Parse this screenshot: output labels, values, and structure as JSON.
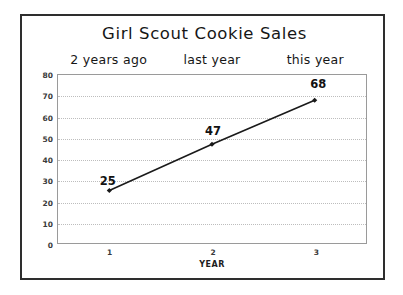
{
  "chart_data": {
    "type": "line",
    "title": "Girl Scout Cookie Sales",
    "xlabel": "YEAR",
    "ylabel": "BOXES",
    "x": [
      1,
      2,
      3
    ],
    "categories": [
      "1",
      "2",
      "3"
    ],
    "values": [
      25,
      47,
      68
    ],
    "point_labels": [
      "25",
      "47",
      "68"
    ],
    "xlim": [
      0.5,
      3.5
    ],
    "ylim": [
      0,
      80
    ],
    "y_ticks": [
      0,
      10,
      20,
      30,
      40,
      50,
      60,
      70,
      80
    ],
    "y_tick_labels": [
      "0",
      "10",
      "20",
      "30",
      "40",
      "50",
      "60",
      "70",
      "80"
    ],
    "x_ticks": [
      1,
      2,
      3
    ],
    "x_tick_labels": [
      "1",
      "2",
      "3"
    ],
    "grid": "horizontal-dotted",
    "legend": "none",
    "annotations": [
      {
        "text": "2 years ago",
        "at_x": 1
      },
      {
        "text": "last year",
        "at_x": 2
      },
      {
        "text": "this year",
        "at_x": 3
      }
    ],
    "series": [
      {
        "name": "Boxes sold",
        "values": [
          25,
          47,
          68
        ]
      }
    ]
  },
  "colors": {
    "outer_border": "#2e2e2e",
    "plot_border": "#9a9a9a",
    "gridline": "#bdbdbd",
    "line": "#1a1a1a",
    "marker": "#1a1a1a",
    "text": "#161616",
    "background": "#ffffff"
  }
}
